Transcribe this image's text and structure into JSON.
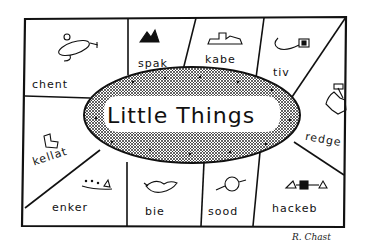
{
  "cartoon": {
    "title": "Little Things",
    "signature": "R. Chast",
    "cells": [
      {
        "label": "chent",
        "icon": "ufo-creature-icon"
      },
      {
        "label": "spak",
        "icon": "mountain-peaks-icon"
      },
      {
        "label": "kabe",
        "icon": "stepped-block-icon"
      },
      {
        "label": "tiv",
        "icon": "hook-with-square-icon"
      },
      {
        "label": "redge",
        "icon": "clamp-icon"
      },
      {
        "label": "hackeb",
        "icon": "triangle-square-triangle-icon"
      },
      {
        "label": "sood",
        "icon": "round-fruit-icon"
      },
      {
        "label": "bie",
        "icon": "fish-creature-icon"
      },
      {
        "label": "enker",
        "icon": "dotted-triangle-line-icon"
      },
      {
        "label": "kellat",
        "icon": "angular-l-shape-icon"
      }
    ]
  }
}
